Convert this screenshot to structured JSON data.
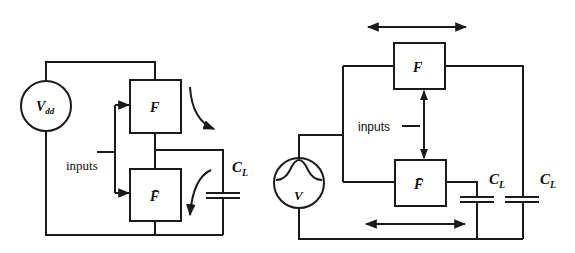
{
  "left_diagram": {
    "source_label": "V",
    "source_subscript": "dd",
    "gate_top_label": "F",
    "gate_bottom_label": "F̄",
    "inputs_label": "inputs",
    "cap_label": "C",
    "cap_subscript": "L"
  },
  "right_diagram": {
    "source_label": "V",
    "gate_top_label": "F",
    "gate_bottom_label": "F̄",
    "inputs_label": "inputs",
    "cap1_label": "C",
    "cap1_subscript": "L",
    "cap2_label": "C",
    "cap2_subscript": "L"
  },
  "colors": {
    "line": "#1a1a1a",
    "background": "#ffffff"
  }
}
